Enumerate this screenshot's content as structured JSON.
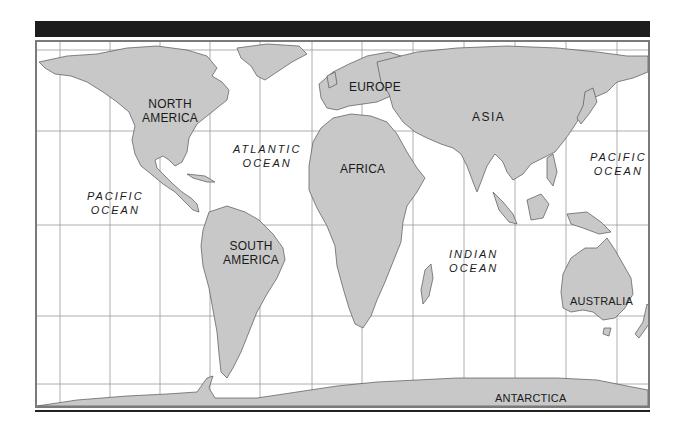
{
  "map": {
    "projection_style": "Robinson-like world map",
    "colors": {
      "land": "#c8c8c8",
      "coast": "#555555",
      "water": "#ffffff",
      "grid": "#9a9a9a",
      "frame": "#7a7a7a",
      "bar": "#1d1d1d"
    },
    "continents": {
      "north_america": "NORTH\nAMERICA",
      "south_america": "SOUTH\nAMERICA",
      "europe": "EUROPE",
      "africa": "AFRICA",
      "asia": "ASIA",
      "australia": "AUSTRALIA",
      "antarctica": "ANTARCTICA"
    },
    "oceans": {
      "pacific_west": "PACIFIC\nOCEAN",
      "atlantic": "ATLANTIC\nOCEAN",
      "indian": "INDIAN\nOCEAN",
      "pacific_east": "PACIFIC\nOCEAN"
    }
  }
}
